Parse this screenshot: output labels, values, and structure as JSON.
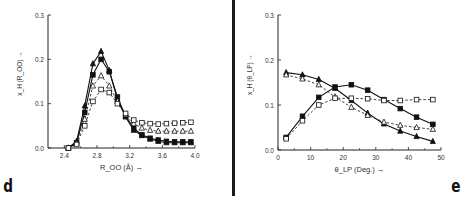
{
  "panels": {
    "d": {
      "letter": "d"
    },
    "e": {
      "letter": "e"
    }
  },
  "chart_data": [
    {
      "panel": "d",
      "type": "line",
      "title": "",
      "xlabel": "R_OO (Å) →",
      "ylabel": "x_H (R_OO) →",
      "xlim": [
        2.2,
        4.0
      ],
      "ylim": [
        0.0,
        0.3
      ],
      "xticks": [
        2.4,
        2.8,
        3.2,
        3.6,
        4.0
      ],
      "xtick_labels": [
        "2.4",
        "2.8",
        "3.2",
        "3.6",
        "4.0"
      ],
      "yticks": [
        0.0,
        0.1,
        0.2,
        0.3
      ],
      "ytick_labels": [
        "0.0",
        "0.1",
        "0.2",
        "0.3"
      ],
      "grid": false,
      "legend": null,
      "x": [
        2.45,
        2.55,
        2.65,
        2.75,
        2.85,
        2.95,
        3.05,
        3.15,
        3.25,
        3.35,
        3.45,
        3.55,
        3.65,
        3.75,
        3.85,
        3.95
      ],
      "series": [
        {
          "name": "filled triangles (solid)",
          "marker": "filled-triangle",
          "line": "solid",
          "values": [
            0.0,
            0.015,
            0.095,
            0.19,
            0.218,
            0.175,
            0.11,
            0.07,
            0.04,
            0.028,
            0.02,
            0.015,
            0.012,
            0.012,
            0.012,
            0.012
          ]
        },
        {
          "name": "filled squares (solid)",
          "marker": "filled-square",
          "line": "solid",
          "values": [
            0.0,
            0.012,
            0.08,
            0.165,
            0.2,
            0.172,
            0.115,
            0.072,
            0.045,
            0.03,
            0.022,
            0.018,
            0.015,
            0.014,
            0.014,
            0.014
          ]
        },
        {
          "name": "open triangles (dashed)",
          "marker": "open-triangle",
          "line": "dashed",
          "values": [
            0.0,
            0.01,
            0.065,
            0.14,
            0.163,
            0.14,
            0.105,
            0.075,
            0.055,
            0.045,
            0.04,
            0.038,
            0.038,
            0.038,
            0.038,
            0.038
          ]
        },
        {
          "name": "open squares (dashed)",
          "marker": "open-square",
          "line": "dashed",
          "values": [
            0.0,
            0.008,
            0.05,
            0.105,
            0.132,
            0.125,
            0.1,
            0.078,
            0.063,
            0.057,
            0.055,
            0.054,
            0.055,
            0.056,
            0.057,
            0.058
          ]
        }
      ]
    },
    {
      "panel": "e",
      "type": "line",
      "title": "",
      "xlabel": "θ_LP (Deg.) →",
      "ylabel": "x_H (θ_LP) →",
      "xlim": [
        0,
        50
      ],
      "ylim": [
        0.0,
        0.3
      ],
      "xticks": [
        0,
        10,
        20,
        30,
        40,
        50
      ],
      "xtick_labels": [
        "0",
        "10",
        "20",
        "30",
        "40",
        "50"
      ],
      "yticks": [
        0.0,
        0.1,
        0.2,
        0.3
      ],
      "ytick_labels": [
        "0.0",
        "0.1",
        "0.2",
        "0.3"
      ],
      "grid": false,
      "legend": null,
      "x": [
        2.5,
        7.5,
        12.5,
        17.5,
        22.5,
        27.5,
        32.5,
        37.5,
        42.5,
        47.5
      ],
      "series": [
        {
          "name": "filled triangles (solid, decreasing)",
          "marker": "filled-triangle",
          "line": "solid",
          "values": [
            0.172,
            0.167,
            0.157,
            0.137,
            0.11,
            0.082,
            0.058,
            0.042,
            0.03,
            0.019
          ]
        },
        {
          "name": "filled squares (solid, peak ~22°)",
          "marker": "filled-square",
          "line": "solid",
          "values": [
            0.028,
            0.075,
            0.117,
            0.14,
            0.145,
            0.133,
            0.112,
            0.092,
            0.073,
            0.057
          ]
        },
        {
          "name": "open triangles (dashed, decreasing)",
          "marker": "open-triangle",
          "line": "dashed",
          "values": [
            0.167,
            0.158,
            0.145,
            0.118,
            0.095,
            0.077,
            0.062,
            0.055,
            0.05,
            0.046
          ]
        },
        {
          "name": "open squares (dashed, plateau)",
          "marker": "open-square",
          "line": "dashed",
          "values": [
            0.025,
            0.065,
            0.1,
            0.115,
            0.115,
            0.114,
            0.11,
            0.11,
            0.112,
            0.112
          ]
        }
      ]
    }
  ]
}
